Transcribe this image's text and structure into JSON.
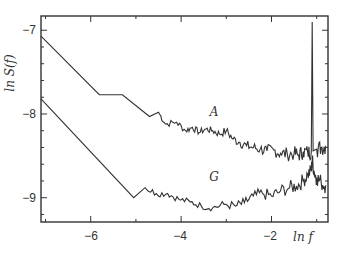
{
  "chart_data": {
    "type": "line",
    "title": "",
    "xlabel": "ln f",
    "ylabel": "ln S(f)",
    "xlim": [
      -7.1,
      -0.75
    ],
    "ylim": [
      -9.29,
      -6.83
    ],
    "xticks": [
      -6,
      -4,
      -2
    ],
    "xtick_labels": [
      "−6",
      "−4",
      "−2"
    ],
    "yticks": [
      -7,
      -8,
      -9
    ],
    "ytick_labels": [
      "−7",
      "−8",
      "−9"
    ],
    "grid": false,
    "legend": "none (inline labels)",
    "annotations": [
      {
        "text": "A",
        "x": -3.5,
        "y": -7.97
      },
      {
        "text": "G",
        "x": -3.5,
        "y": -8.75
      }
    ],
    "series": [
      {
        "name": "A",
        "x": [
          -7.1,
          -5.81,
          -5.3,
          -4.7,
          -4.5,
          -4.35,
          -4.1,
          -3.9,
          -3.75,
          -3.6,
          -3.45,
          -3.3,
          -3.15,
          -3.0,
          -2.85,
          -2.7,
          -2.55,
          -2.4,
          -2.25,
          -2.1,
          -1.95,
          -1.8,
          -1.65,
          -1.5,
          -1.4,
          -1.3,
          -1.2,
          -1.12,
          -1.1,
          -1.08,
          -1.0,
          -0.9,
          -0.8
        ],
        "y": [
          -7.07,
          -7.77,
          -7.77,
          -8.03,
          -7.98,
          -8.12,
          -8.1,
          -8.2,
          -8.16,
          -8.22,
          -8.18,
          -8.2,
          -8.24,
          -8.2,
          -8.3,
          -8.34,
          -8.38,
          -8.4,
          -8.42,
          -8.44,
          -8.43,
          -8.47,
          -8.48,
          -8.47,
          -8.49,
          -8.45,
          -8.46,
          -8.45,
          -6.9,
          -8.44,
          -8.42,
          -8.4,
          -8.38
        ]
      },
      {
        "name": "G",
        "x": [
          -7.1,
          -5.05,
          -4.8,
          -4.55,
          -4.3,
          -4.05,
          -3.8,
          -3.55,
          -3.3,
          -3.05,
          -2.8,
          -2.6,
          -2.4,
          -2.2,
          -2.0,
          -1.8,
          -1.6,
          -1.45,
          -1.3,
          -1.2,
          -1.12,
          -1.1,
          -1.05,
          -1.0,
          -0.9,
          -0.8
        ],
        "y": [
          -7.82,
          -9.0,
          -8.88,
          -8.95,
          -8.95,
          -9.02,
          -9.05,
          -9.1,
          -9.12,
          -9.08,
          -9.1,
          -9.06,
          -8.98,
          -8.95,
          -8.98,
          -8.92,
          -8.88,
          -8.86,
          -8.8,
          -8.72,
          -8.68,
          -8.55,
          -8.7,
          -8.76,
          -8.82,
          -8.85
        ]
      }
    ]
  },
  "labels": {
    "ylabel": "ln S(f)",
    "xlabel": "ln f",
    "series_a": "A",
    "series_g": "G",
    "xtick_m6": "−6",
    "xtick_m4": "−4",
    "xtick_m2": "−2",
    "ytick_m7": "−7",
    "ytick_m8": "−8",
    "ytick_m9": "−9"
  }
}
